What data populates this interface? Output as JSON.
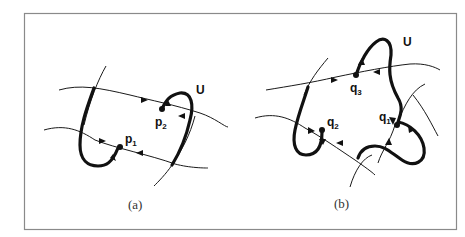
{
  "figure": {
    "panels": [
      {
        "id": "a",
        "caption": "(a)",
        "region_label": "U",
        "points": [
          {
            "base": "p",
            "sub": "1"
          },
          {
            "base": "p",
            "sub": "2"
          }
        ]
      },
      {
        "id": "b",
        "caption": "(b)",
        "region_label": "U",
        "points": [
          {
            "base": "q",
            "sub": "1"
          },
          {
            "base": "q",
            "sub": "2"
          },
          {
            "base": "q",
            "sub": "3"
          }
        ]
      }
    ],
    "colors": {
      "stroke": "#111111",
      "frame": "#8a8a8a",
      "background": "#ffffff"
    }
  }
}
